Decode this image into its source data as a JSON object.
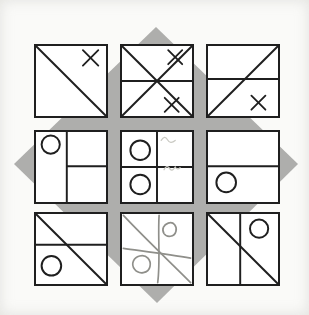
{
  "figure": {
    "colors": {
      "page_bg": "#fafaf8",
      "paper": "#ffffff",
      "ink": "#1f1f1f",
      "pencil": "#8f8f8a",
      "faint_pencil": "#c9c9c2",
      "diamond": "#aeaeac"
    },
    "diamond_points": "156,27 298,164 157,303 14,164",
    "grid": {
      "cols_x": [
        34,
        120,
        206
      ],
      "rows_y": [
        44,
        130,
        212
      ],
      "cell_outer_size": 74
    },
    "cells": [
      {
        "name": "r1c1",
        "row": 0,
        "col": 0,
        "shapes": [
          {
            "type": "line",
            "x1": 0,
            "y1": 0,
            "x2": 100,
            "y2": 100
          },
          {
            "type": "cross",
            "cx": 78,
            "cy": 17,
            "r": 11
          }
        ]
      },
      {
        "name": "r1c2",
        "row": 0,
        "col": 1,
        "shapes": [
          {
            "type": "line",
            "x1": 0,
            "y1": 0,
            "x2": 100,
            "y2": 100
          },
          {
            "type": "line",
            "x1": 100,
            "y1": 0,
            "x2": 0,
            "y2": 100
          },
          {
            "type": "line",
            "x1": 0,
            "y1": 50,
            "x2": 100,
            "y2": 50
          },
          {
            "type": "cross",
            "cx": 76,
            "cy": 16,
            "r": 10
          },
          {
            "type": "cross",
            "cx": 71,
            "cy": 84,
            "r": 10
          }
        ]
      },
      {
        "name": "r1c3",
        "row": 0,
        "col": 2,
        "shapes": [
          {
            "type": "line",
            "x1": 0,
            "y1": 47,
            "x2": 100,
            "y2": 47
          },
          {
            "type": "line",
            "x1": 0,
            "y1": 100,
            "x2": 100,
            "y2": 0
          },
          {
            "type": "cross",
            "cx": 72,
            "cy": 81,
            "r": 10
          }
        ]
      },
      {
        "name": "r2c1",
        "row": 1,
        "col": 0,
        "shapes": [
          {
            "type": "line",
            "x1": 44,
            "y1": 0,
            "x2": 44,
            "y2": 100
          },
          {
            "type": "line",
            "x1": 44,
            "y1": 49,
            "x2": 100,
            "y2": 49
          },
          {
            "type": "circle",
            "cx": 21,
            "cy": 18,
            "r": 13
          }
        ]
      },
      {
        "name": "r2c2",
        "row": 1,
        "col": 1,
        "shapes": [
          {
            "type": "line",
            "x1": 50,
            "y1": 0,
            "x2": 50,
            "y2": 100
          },
          {
            "type": "line",
            "x1": 0,
            "y1": 50,
            "x2": 100,
            "y2": 50
          },
          {
            "type": "circle",
            "cx": 26,
            "cy": 26,
            "r": 14
          },
          {
            "type": "circle",
            "cx": 26,
            "cy": 75,
            "r": 14
          },
          {
            "type": "path",
            "d": "M56,12 q5,-8 9,-1 q4,7 11,1",
            "stroke": "faint"
          },
          {
            "type": "path",
            "d": "M60,54 q4,-8 8,-2 q3,6 8,-2 q3,5 7,1",
            "stroke": "faint"
          }
        ]
      },
      {
        "name": "r2c3",
        "row": 1,
        "col": 2,
        "shapes": [
          {
            "type": "line",
            "x1": 0,
            "y1": 49,
            "x2": 100,
            "y2": 49
          },
          {
            "type": "circle",
            "cx": 26,
            "cy": 72,
            "r": 14
          }
        ]
      },
      {
        "name": "r3c1",
        "row": 2,
        "col": 0,
        "shapes": [
          {
            "type": "line",
            "x1": 0,
            "y1": 44,
            "x2": 100,
            "y2": 44
          },
          {
            "type": "line",
            "x1": 0,
            "y1": 0,
            "x2": 100,
            "y2": 100
          },
          {
            "type": "circle",
            "cx": 22,
            "cy": 74,
            "r": 14
          }
        ]
      },
      {
        "name": "r3c2",
        "row": 2,
        "col": 1,
        "shapes": [
          {
            "type": "path",
            "d": "M2,2 C32,34 64,64 98,98",
            "stroke": "pencil"
          },
          {
            "type": "path",
            "d": "M53,2 C51,30 55,68 51,98",
            "stroke": "pencil"
          },
          {
            "type": "path",
            "d": "M2,49 C30,53 68,58 98,63",
            "stroke": "pencil"
          },
          {
            "type": "path",
            "d": "M66,13 c8,-3 13,5 11,12 c-2,8 -13,9 -17,3 c-4,-7 0,-13 6,-15",
            "stroke": "pencil"
          },
          {
            "type": "path",
            "d": "M25,60 c10,-3 17,6 15,15 c-2,10 -16,12 -22,4 c-6,-8 -1,-17 7,-19",
            "stroke": "pencil"
          }
        ]
      },
      {
        "name": "r3c3",
        "row": 2,
        "col": 2,
        "shapes": [
          {
            "type": "line",
            "x1": 46,
            "y1": 0,
            "x2": 46,
            "y2": 100
          },
          {
            "type": "line",
            "x1": 0,
            "y1": 0,
            "x2": 100,
            "y2": 100
          },
          {
            "type": "circle",
            "cx": 73,
            "cy": 21,
            "r": 13
          }
        ]
      }
    ]
  }
}
